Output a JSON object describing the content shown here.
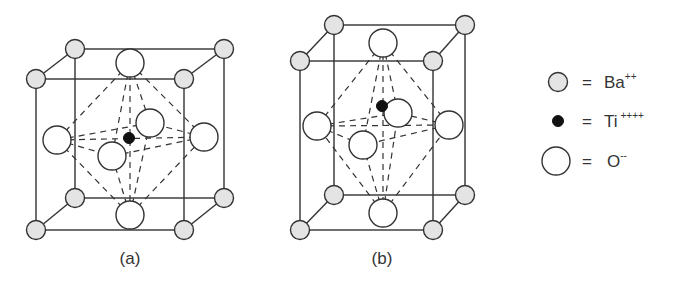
{
  "figure": {
    "panels": [
      {
        "label": "(a)",
        "description": "cubic BaTiO3 perovskite unit cell, Ti centered"
      },
      {
        "label": "(b)",
        "description": "tetragonal BaTiO3 unit cell, Ti displaced upward"
      }
    ],
    "legend": [
      {
        "symbol": "gray-circle",
        "eq": "=",
        "species": "Ba",
        "charge": "++"
      },
      {
        "symbol": "black-dot",
        "eq": "=",
        "species": "Ti",
        "charge": "++++"
      },
      {
        "symbol": "white-circle",
        "eq": "=",
        "species": "O",
        "charge": "--"
      }
    ],
    "colors": {
      "ba_fill": "#e4e4e4",
      "ti_fill": "#111111",
      "o_fill": "#ffffff",
      "line": "#333333"
    }
  }
}
